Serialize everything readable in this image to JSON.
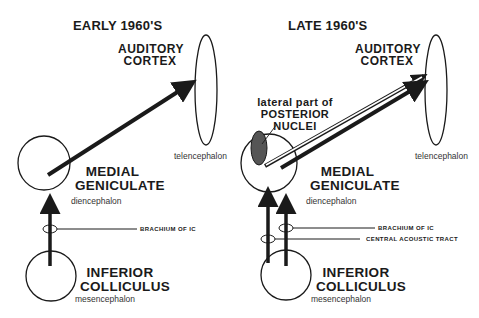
{
  "panels": [
    {
      "title": "EARLY 1960'S",
      "cortex_label": [
        "AUDITORY",
        "CORTEX"
      ],
      "cortex_region": "telencephalon",
      "mg_label": [
        "MEDIAL",
        "GENICULATE"
      ],
      "mg_region": "diencephalon",
      "ic_label": [
        "INFERIOR",
        "COLLICULUS"
      ],
      "ic_region": "mesencephalon",
      "pathways": [
        "BRACHIUM OF IC"
      ]
    },
    {
      "title": "LATE 1960'S",
      "cortex_label": [
        "AUDITORY",
        "CORTEX"
      ],
      "cortex_region": "telencephalon",
      "pn_label": [
        "lateral part of",
        "POSTERIOR",
        "NUCLEI"
      ],
      "mg_label": [
        "MEDIAL",
        "GENICULATE"
      ],
      "mg_region": "diencephalon",
      "ic_label": [
        "INFERIOR",
        "COLLICULUS"
      ],
      "ic_region": "mesencephalon",
      "pathways": [
        "BRACHIUM OF IC",
        "CENTRAL ACOUSTIC TRACT"
      ]
    }
  ],
  "colors": {
    "line": "#1a1a1a",
    "nuclei_fill": "#555555",
    "background": "#ffffff"
  }
}
